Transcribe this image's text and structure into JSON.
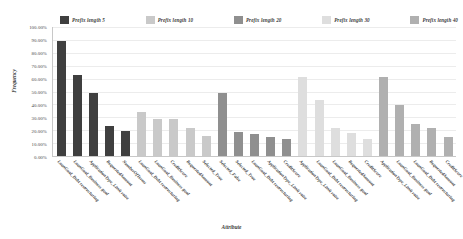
{
  "chart_data": {
    "type": "bar",
    "title": "",
    "xlabel": "Attribute",
    "ylabel": "Frequency",
    "ylim": [
      0,
      100
    ],
    "ytick_labels": [
      "100.00%",
      "90.00%",
      "80.00%",
      "70.00%",
      "60.00%",
      "50.00%",
      "40.00%",
      "30.00%",
      "20.00%",
      "10.00%",
      "0.00%"
    ],
    "ytick_values": [
      100,
      90,
      80,
      70,
      60,
      50,
      40,
      30,
      20,
      10,
      0
    ],
    "grid": true,
    "legend_position": "top",
    "legend": [
      {
        "name": "Prefix length 5",
        "color": "#3f3f3f"
      },
      {
        "name": "Prefix length 10",
        "color": "#c9c9c9"
      },
      {
        "name": "Prefix length 20",
        "color": "#8f8f8f"
      },
      {
        "name": "Prefix length 30",
        "color": "#dedede"
      },
      {
        "name": "Prefix length 40",
        "color": "#b0b0b0"
      }
    ],
    "categories": [
      "LoanGoal_Debt restructuring",
      "LoanGoal_Business goal",
      "ApplicationType_Limit raise",
      "RequestedAmount",
      "NumberOfTerms",
      "LoanGoal_Debt restructuring",
      "LoanGoal_Business goal",
      "CreditScore",
      "RequestedAmount",
      "Selected_True",
      "Selected_False",
      "Selected_True",
      "LoanGoal_Debt restructuring",
      "ApplicationType_Limit raise",
      "CreditScore",
      "ApplicationType_Limit raise",
      "LoanGoal_Debt restructuring",
      "LoanGoal_Business goal",
      "RequestedAmount",
      "CreditScore",
      "ApplicationType_Limit raise",
      "LoanGoal_Business goal",
      "LoanGoal_Debt restructuring",
      "RequestedAmount",
      "CreditScore"
    ],
    "bars": [
      {
        "value": 89.0,
        "series": "Prefix length 5",
        "color": "#3f3f3f"
      },
      {
        "value": 62.5,
        "series": "Prefix length 5",
        "color": "#3f3f3f"
      },
      {
        "value": 48.5,
        "series": "Prefix length 5",
        "color": "#3f3f3f"
      },
      {
        "value": 23.5,
        "series": "Prefix length 5",
        "color": "#3f3f3f"
      },
      {
        "value": 19.5,
        "series": "Prefix length 5",
        "color": "#3f3f3f"
      },
      {
        "value": 34.0,
        "series": "Prefix length 10",
        "color": "#c9c9c9"
      },
      {
        "value": 29.0,
        "series": "Prefix length 10",
        "color": "#c9c9c9"
      },
      {
        "value": 28.5,
        "series": "Prefix length 10",
        "color": "#c9c9c9"
      },
      {
        "value": 21.5,
        "series": "Prefix length 10",
        "color": "#c9c9c9"
      },
      {
        "value": 15.5,
        "series": "Prefix length 10",
        "color": "#c9c9c9"
      },
      {
        "value": 48.5,
        "series": "Prefix length 20",
        "color": "#8f8f8f"
      },
      {
        "value": 18.5,
        "series": "Prefix length 20",
        "color": "#8f8f8f"
      },
      {
        "value": 17.0,
        "series": "Prefix length 20",
        "color": "#8f8f8f"
      },
      {
        "value": 15.0,
        "series": "Prefix length 20",
        "color": "#8f8f8f"
      },
      {
        "value": 13.5,
        "series": "Prefix length 20",
        "color": "#8f8f8f"
      },
      {
        "value": 61.5,
        "series": "Prefix length 30",
        "color": "#dedede"
      },
      {
        "value": 43.5,
        "series": "Prefix length 30",
        "color": "#dedede"
      },
      {
        "value": 22.0,
        "series": "Prefix length 30",
        "color": "#dedede"
      },
      {
        "value": 18.0,
        "series": "Prefix length 30",
        "color": "#dedede"
      },
      {
        "value": 13.0,
        "series": "Prefix length 30",
        "color": "#dedede"
      },
      {
        "value": 61.5,
        "series": "Prefix length 40",
        "color": "#b0b0b0"
      },
      {
        "value": 39.5,
        "series": "Prefix length 40",
        "color": "#b0b0b0"
      },
      {
        "value": 25.0,
        "series": "Prefix length 40",
        "color": "#b0b0b0"
      },
      {
        "value": 21.5,
        "series": "Prefix length 40",
        "color": "#b0b0b0"
      },
      {
        "value": 14.5,
        "series": "Prefix length 40",
        "color": "#b0b0b0"
      }
    ]
  }
}
